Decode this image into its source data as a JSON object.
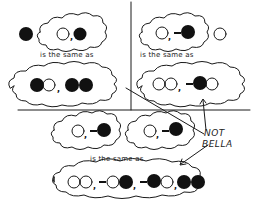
{
  "colors": {
    "ink": "#1a1a1a",
    "background": "#ffffff",
    "filled_ball": "#111111",
    "open_ball": "#ffffff"
  },
  "legend": {
    "filled": "black ball",
    "open": "white ball",
    "bond": "-"
  },
  "panels": {
    "top_left": {
      "top_free_ball": "filled",
      "top_cloud": [
        "open",
        ",",
        "filled"
      ],
      "connector": "is the same as",
      "bottom_cloud": [
        "filled",
        "open",
        ",",
        "filled",
        "filled"
      ]
    },
    "top_right": {
      "top_cloud": [
        "open",
        ",",
        "-",
        "filled"
      ],
      "top_free_ball": "open",
      "connector": "is the same as",
      "bottom_cloud": [
        "open",
        "open",
        ",",
        "-",
        "filled",
        "open"
      ]
    },
    "bottom": {
      "top_clouds": [
        [
          "open",
          ",",
          "-",
          "filled"
        ],
        [
          "open",
          ",",
          "-",
          "filled"
        ]
      ],
      "connector": "is the same as",
      "bottom_cloud": [
        "open",
        "open",
        ",",
        "-",
        "open",
        "filled",
        ",",
        "-",
        "filled",
        "open",
        ",",
        "filled",
        "filled"
      ]
    }
  },
  "labels": {
    "same_top_left": "is the same as",
    "same_top_right": "is the same as",
    "same_bottom": "is the same as",
    "not_line1": "NOT",
    "not_line2": "BELLA"
  }
}
